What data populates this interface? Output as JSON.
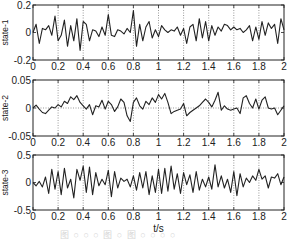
{
  "figure": {
    "x_axis_label": "t/s",
    "caption": "图 ○ ○ ○ 图 ○ 图 ○ ○ ○ ○"
  },
  "chart_data": [
    {
      "type": "line",
      "title": "",
      "ylabel": "state-1",
      "xlabel": "",
      "xlim": [
        0,
        2
      ],
      "ylim": [
        -0.2,
        0.2
      ],
      "xticks": [
        "0",
        "0.2",
        "0.4",
        "0.6",
        "0.8",
        "1",
        "1.2",
        "1.4",
        "1.6",
        "1.8",
        "2"
      ],
      "yticks": [
        "-0.2",
        "0",
        "0.2"
      ],
      "grid": "vertical-dotted",
      "dashed_zero_line": false,
      "series": [
        {
          "name": "state-1",
          "x": [
            0,
            0.025,
            0.05,
            0.075,
            0.1,
            0.125,
            0.15,
            0.175,
            0.2,
            0.225,
            0.25,
            0.275,
            0.3,
            0.325,
            0.35,
            0.375,
            0.4,
            0.425,
            0.45,
            0.475,
            0.5,
            0.525,
            0.55,
            0.575,
            0.6,
            0.625,
            0.65,
            0.675,
            0.7,
            0.725,
            0.75,
            0.775,
            0.8,
            0.825,
            0.85,
            0.875,
            0.9,
            0.925,
            0.95,
            0.975,
            1.0,
            1.025,
            1.05,
            1.075,
            1.1,
            1.125,
            1.15,
            1.175,
            1.2,
            1.225,
            1.25,
            1.275,
            1.3,
            1.325,
            1.35,
            1.375,
            1.4,
            1.425,
            1.45,
            1.475,
            1.5,
            1.525,
            1.55,
            1.575,
            1.6,
            1.625,
            1.65,
            1.675,
            1.7,
            1.725,
            1.75,
            1.775,
            1.8,
            1.825,
            1.85,
            1.875,
            1.9,
            1.925,
            1.95,
            1.975,
            2.0
          ],
          "values": [
            0,
            0.06,
            -0.08,
            0.03,
            0.02,
            0.05,
            -0.02,
            0.12,
            -0.06,
            -0.02,
            0.09,
            -0.1,
            0.05,
            -0.06,
            0.1,
            -0.13,
            0.08,
            0.06,
            -0.06,
            0.02,
            0.01,
            -0.03,
            0.04,
            -0.02,
            0.13,
            -0.02,
            -0.03,
            0.02,
            0.01,
            -0.01,
            0.03,
            0.0,
            0.16,
            -0.1,
            0.06,
            -0.06,
            0.04,
            0.08,
            -0.04,
            0.02,
            -0.03,
            0.05,
            0.02,
            0.0,
            0.02,
            0.01,
            0.04,
            -0.02,
            0.03,
            -0.08,
            0.04,
            0.06,
            -0.06,
            0.1,
            -0.04,
            0.08,
            -0.06,
            0.05,
            -0.02,
            0.04,
            0.01,
            0.06,
            0.05,
            0.02,
            0.04,
            0.02,
            0.03,
            0.0,
            0.02,
            0.05,
            -0.06,
            0.04,
            -0.05,
            0.08,
            -0.02,
            0.07,
            0.03,
            0.06,
            -0.08,
            0.1,
            0.02
          ]
        }
      ]
    },
    {
      "type": "line",
      "title": "",
      "ylabel": "state-2",
      "xlabel": "",
      "xlim": [
        0,
        2
      ],
      "ylim": [
        -0.05,
        0.05
      ],
      "xticks": [
        "0",
        "0.2",
        "0.4",
        "0.6",
        "0.8",
        "1",
        "1.2",
        "1.4",
        "1.6",
        "1.8",
        "2"
      ],
      "yticks": [
        "-0.05",
        "0",
        "0.05"
      ],
      "grid": "vertical-dotted",
      "dashed_zero_line": true,
      "series": [
        {
          "name": "state-2",
          "x": [
            0,
            0.025,
            0.05,
            0.075,
            0.1,
            0.125,
            0.15,
            0.175,
            0.2,
            0.225,
            0.25,
            0.275,
            0.3,
            0.325,
            0.35,
            0.375,
            0.4,
            0.425,
            0.45,
            0.475,
            0.5,
            0.525,
            0.55,
            0.575,
            0.6,
            0.625,
            0.65,
            0.675,
            0.7,
            0.725,
            0.75,
            0.775,
            0.8,
            0.825,
            0.85,
            0.875,
            0.9,
            0.925,
            0.95,
            0.975,
            1.0,
            1.025,
            1.05,
            1.075,
            1.1,
            1.125,
            1.15,
            1.175,
            1.2,
            1.225,
            1.25,
            1.275,
            1.3,
            1.325,
            1.35,
            1.375,
            1.4,
            1.425,
            1.45,
            1.475,
            1.5,
            1.525,
            1.55,
            1.575,
            1.6,
            1.625,
            1.65,
            1.675,
            1.7,
            1.725,
            1.75,
            1.775,
            1.8,
            1.825,
            1.85,
            1.875,
            1.9,
            1.925,
            1.95,
            1.975,
            2.0
          ],
          "values": [
            0,
            0.005,
            -0.002,
            -0.008,
            -0.01,
            -0.004,
            0.002,
            0.0,
            0.006,
            0.002,
            0.012,
            0.008,
            0.02,
            0.015,
            0.022,
            0.01,
            0.004,
            -0.002,
            0.006,
            -0.012,
            0.004,
            0.002,
            0.014,
            -0.002,
            0.012,
            0.006,
            -0.006,
            0.002,
            0.016,
            0.01,
            -0.014,
            -0.024,
            0.01,
            0.018,
            0.004,
            -0.002,
            0.012,
            0.006,
            0.018,
            0.01,
            0.024,
            0.016,
            0.026,
            0.01,
            -0.01,
            -0.006,
            -0.004,
            -0.002,
            0.008,
            -0.014,
            -0.008,
            -0.004,
            0.0,
            0.004,
            0.01,
            0.016,
            0.01,
            0.002,
            0.014,
            0.028,
            -0.004,
            0.004,
            -0.002,
            -0.004,
            -0.002,
            0.0,
            -0.01,
            0.018,
            0.022,
            0.008,
            0.0,
            0.016,
            -0.002,
            0.014,
            0.02,
            0.0,
            -0.002,
            0.0,
            -0.012,
            -0.004,
            0.004
          ]
        }
      ]
    },
    {
      "type": "line",
      "title": "",
      "ylabel": "state-3",
      "xlabel": "t/s",
      "xlim": [
        0,
        2
      ],
      "ylim": [
        -0.5,
        0.5
      ],
      "xticks": [
        "0",
        "0.2",
        "0.4",
        "0.6",
        "0.8",
        "1",
        "1.2",
        "1.4",
        "1.6",
        "1.8",
        "2"
      ],
      "yticks": [
        "-0.5",
        "0",
        "0.5"
      ],
      "grid": "vertical-dotted",
      "dashed_zero_line": false,
      "series": [
        {
          "name": "state-3",
          "x": [
            0,
            0.025,
            0.05,
            0.075,
            0.1,
            0.125,
            0.15,
            0.175,
            0.2,
            0.225,
            0.25,
            0.275,
            0.3,
            0.325,
            0.35,
            0.375,
            0.4,
            0.425,
            0.45,
            0.475,
            0.5,
            0.525,
            0.55,
            0.575,
            0.6,
            0.625,
            0.65,
            0.675,
            0.7,
            0.725,
            0.75,
            0.775,
            0.8,
            0.825,
            0.85,
            0.875,
            0.9,
            0.925,
            0.95,
            0.975,
            1.0,
            1.025,
            1.05,
            1.075,
            1.1,
            1.125,
            1.15,
            1.175,
            1.2,
            1.225,
            1.25,
            1.275,
            1.3,
            1.325,
            1.35,
            1.375,
            1.4,
            1.425,
            1.45,
            1.475,
            1.5,
            1.525,
            1.55,
            1.575,
            1.6,
            1.625,
            1.65,
            1.675,
            1.7,
            1.725,
            1.75,
            1.775,
            1.8,
            1.825,
            1.85,
            1.875,
            1.9,
            1.925,
            1.95,
            1.975,
            2.0
          ],
          "values": [
            0,
            -0.06,
            0.02,
            -0.08,
            0.1,
            -0.2,
            0.24,
            -0.12,
            0.2,
            -0.22,
            0.26,
            -0.1,
            0.06,
            -0.28,
            0.24,
            0.04,
            0.3,
            -0.18,
            0.28,
            -0.22,
            0.18,
            -0.06,
            0.06,
            -0.04,
            0.22,
            -0.26,
            0.2,
            -0.1,
            0.08,
            0.02,
            0.06,
            -0.08,
            0.12,
            -0.14,
            0.18,
            -0.1,
            0.2,
            -0.22,
            0.12,
            -0.18,
            0.24,
            -0.2,
            0.26,
            -0.16,
            0.3,
            -0.12,
            0.16,
            -0.2,
            0.18,
            -0.04,
            0.14,
            -0.18,
            0.2,
            -0.14,
            0.06,
            -0.08,
            0.1,
            -0.12,
            0.32,
            -0.08,
            0.12,
            -0.1,
            0.06,
            -0.18,
            0.2,
            -0.24,
            0.16,
            -0.08,
            0.08,
            0.0,
            0.12,
            0.04,
            0.24,
            0.06,
            0.12,
            -0.1,
            0.1,
            0.08,
            0.16,
            -0.04,
            0.1
          ]
        }
      ]
    }
  ]
}
